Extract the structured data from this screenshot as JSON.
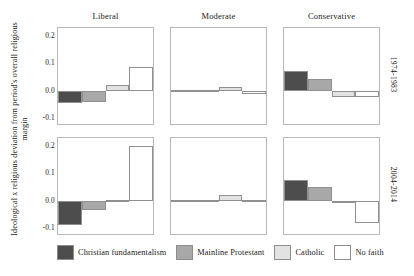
{
  "chart_data": {
    "type": "bar",
    "title": "",
    "xlabel": "",
    "ylabel": "Ideological x religious deviation from period's overall religious margin",
    "ylim": [
      -0.13,
      0.23
    ],
    "yticks": [
      "0.2",
      "0.1",
      "0.0",
      "-0.1"
    ],
    "ytick_values": [
      0.2,
      0.1,
      0.0,
      -0.1
    ],
    "grid": false,
    "legend_position": "bottom",
    "categories": [
      "Christian fundamentalism",
      "Mainline Protestant",
      "Catholic",
      "No faith"
    ],
    "col_facets": [
      "Liberal",
      "Moderate",
      "Conservative"
    ],
    "row_facets": [
      "1974-1983",
      "2004-2014"
    ],
    "panels": [
      {
        "row": "1974-1983",
        "col": "Liberal",
        "values": [
          -0.047,
          -0.041,
          0.022,
          0.088
        ]
      },
      {
        "row": "1974-1983",
        "col": "Moderate",
        "values": [
          0.004,
          0.003,
          0.012,
          -0.011
        ]
      },
      {
        "row": "1974-1983",
        "col": "Conservative",
        "values": [
          0.071,
          0.044,
          -0.022,
          -0.022
        ]
      },
      {
        "row": "2004-2014",
        "col": "Liberal",
        "values": [
          -0.089,
          -0.035,
          0.002,
          0.2
        ]
      },
      {
        "row": "2004-2014",
        "col": "Moderate",
        "values": [
          0.003,
          0.001,
          0.022,
          0.001
        ]
      },
      {
        "row": "2004-2014",
        "col": "Conservative",
        "values": [
          0.077,
          0.051,
          -0.004,
          -0.082
        ]
      }
    ],
    "series_colors": [
      "#4d4d4d",
      "#a8a8a8",
      "#e2e2e2",
      "#ffffff"
    ]
  },
  "legend": {
    "items": [
      {
        "label": "Christian fundamentalism",
        "color": "#4d4d4d"
      },
      {
        "label": "Mainline Protestant",
        "color": "#a8a8a8"
      },
      {
        "label": "Catholic",
        "color": "#e2e2e2"
      },
      {
        "label": "No faith",
        "color": "#ffffff"
      }
    ]
  }
}
